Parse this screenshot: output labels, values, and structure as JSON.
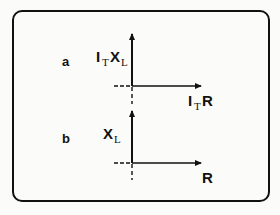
{
  "figure": {
    "panels": [
      {
        "id": "a",
        "label": "a",
        "vertical_axis": {
          "main": "I",
          "sub": "T",
          "main2": "X",
          "sub2": "L"
        },
        "horizontal_axis": {
          "main": "I",
          "sub": "T",
          "main2": "R"
        }
      },
      {
        "id": "b",
        "label": "b",
        "vertical_axis": {
          "main": "X",
          "sub": "L"
        },
        "horizontal_axis": {
          "main": "R"
        }
      }
    ],
    "colors": {
      "ink": "#111111",
      "background": "#fbfbf9"
    }
  }
}
